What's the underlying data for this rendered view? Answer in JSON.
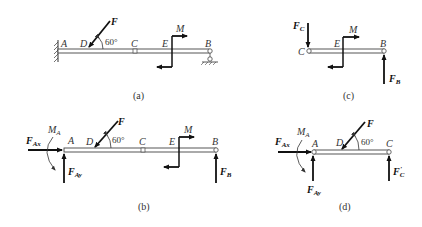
{
  "figures": [
    {
      "id": "a",
      "caption": "(a)",
      "points": {
        "A": "A",
        "D": "D",
        "C": "C",
        "E": "E",
        "B": "B"
      },
      "force_F": "F",
      "angle": "60°",
      "moment": "M"
    },
    {
      "id": "b",
      "caption": "(b)",
      "points": {
        "A": "A",
        "D": "D",
        "C": "C",
        "E": "E",
        "B": "B"
      },
      "force_F": "F",
      "angle": "60°",
      "moment": "M",
      "reactions": {
        "FAx": {
          "main": "F",
          "sub": "Ax"
        },
        "FAy": {
          "main": "F",
          "sub": "Ay"
        },
        "MA": {
          "main": "M",
          "sub": "A"
        },
        "FB": {
          "main": "F",
          "sub": "B"
        }
      }
    },
    {
      "id": "c",
      "caption": "(c)",
      "points": {
        "C": "C",
        "E": "E",
        "B": "B"
      },
      "moment": "M",
      "reactions": {
        "FC": {
          "main": "F",
          "sub": "C"
        },
        "FB": {
          "main": "F",
          "sub": "B"
        }
      }
    },
    {
      "id": "d",
      "caption": "(d)",
      "points": {
        "A": "A",
        "D": "D",
        "C": "C"
      },
      "force_F": "F",
      "angle": "60°",
      "reactions": {
        "FAx": {
          "main": "F",
          "sub": "Ax"
        },
        "FAy": {
          "main": "F",
          "sub": "Ay"
        },
        "MA": {
          "main": "M",
          "sub": "A"
        },
        "FCprime": {
          "main": "F",
          "sub": "C",
          "prime": "′"
        }
      }
    }
  ]
}
